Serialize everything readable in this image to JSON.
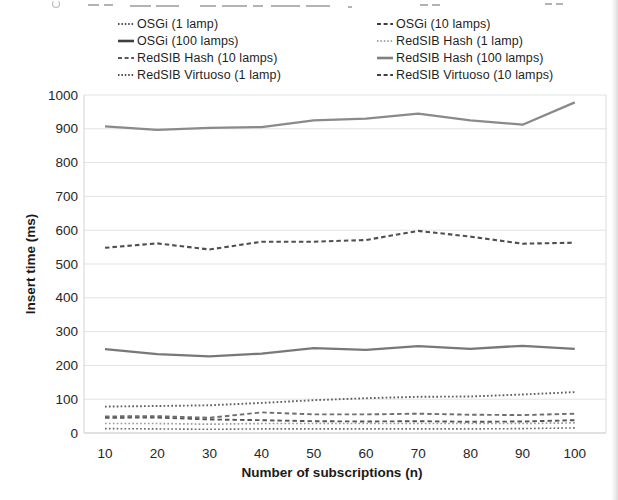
{
  "axes": {
    "y_title": "Insert time (ms)",
    "x_title": "Number of subscriptions (n)",
    "y_tick_labels": [
      "0",
      "100",
      "200",
      "300",
      "400",
      "500",
      "600",
      "700",
      "800",
      "900",
      "1000"
    ],
    "x_tick_labels": [
      "10",
      "20",
      "30",
      "40",
      "50",
      "60",
      "70",
      "80",
      "90",
      "100"
    ]
  },
  "legend": {
    "items": [
      {
        "label": "OSGi (1 lamp)",
        "style": "dotted",
        "color": "#4d4d4d"
      },
      {
        "label": "OSGi (10 lamps)",
        "style": "dashed",
        "color": "#3f3f3f"
      },
      {
        "label": "OSGi (100 lamps)",
        "style": "solid",
        "color": "#3f3f3f"
      },
      {
        "label": "RedSIB Hash (1 lamp)",
        "style": "dotted",
        "color": "#a6a6a6"
      },
      {
        "label": "RedSIB Hash (10 lamps)",
        "style": "dashed",
        "color": "#595959"
      },
      {
        "label": "RedSIB Hash (100 lamps)",
        "style": "solid",
        "color": "#808080"
      },
      {
        "label": "RedSIB Virtuoso (1 lamp)",
        "style": "dotted",
        "color": "#4d4d4d"
      },
      {
        "label": "RedSIB Virtuoso (10 lamps)",
        "style": "dashed",
        "color": "#404040"
      }
    ]
  },
  "chart_data": {
    "type": "line",
    "title": "",
    "xlabel": "Number of subscriptions (n)",
    "ylabel": "Insert time (ms)",
    "x": [
      10,
      20,
      30,
      40,
      50,
      60,
      70,
      80,
      90,
      100
    ],
    "ylim": [
      0,
      1000
    ],
    "ytick_step": 100,
    "grid": "horizontal light gray lines every 100 ms",
    "legend_position": "top, two columns",
    "series": [
      {
        "name": "OSGi (1 lamp)",
        "style": "dotted",
        "color": "#6a6a6a",
        "width": 1.6,
        "values": [
          13,
          12,
          11,
          12,
          12,
          12,
          12,
          12,
          13,
          15
        ]
      },
      {
        "name": "OSGi (10 lamps)",
        "style": "dashed",
        "color": "#565656",
        "width": 1.9,
        "values": [
          45,
          46,
          40,
          38,
          35,
          34,
          35,
          33,
          34,
          38
        ]
      },
      {
        "name": "OSGi (100 lamps)",
        "style": "solid",
        "color": "#787878",
        "width": 2.3,
        "values": [
          248,
          233,
          227,
          235,
          251,
          246,
          257,
          249,
          258,
          249
        ]
      },
      {
        "name": "RedSIB Hash (1 lamp)",
        "style": "dotted",
        "color": "#9b9b9b",
        "width": 1.7,
        "values": [
          28,
          28,
          26,
          28,
          28,
          28,
          28,
          28,
          28,
          30
        ]
      },
      {
        "name": "RedSIB Hash (10 lamps)",
        "style": "dashed",
        "color": "#6e6e6e",
        "width": 1.9,
        "values": [
          49,
          50,
          45,
          61,
          55,
          55,
          57,
          54,
          53,
          57
        ]
      },
      {
        "name": "RedSIB Hash (100 lamps)",
        "style": "solid",
        "color": "#8a8a8a",
        "width": 2.3,
        "values": [
          907,
          897,
          903,
          905,
          925,
          930,
          945,
          925,
          912,
          978
        ]
      },
      {
        "name": "RedSIB Virtuoso (1 lamp)",
        "style": "dotted",
        "color": "#5f5f5f",
        "width": 1.9,
        "values": [
          78,
          80,
          82,
          89,
          97,
          103,
          107,
          108,
          114,
          121
        ]
      },
      {
        "name": "RedSIB Virtuoso (10 lamps)",
        "style": "dashed",
        "color": "#4f4f4f",
        "width": 2.1,
        "values": [
          548,
          561,
          543,
          566,
          566,
          571,
          598,
          581,
          560,
          563
        ]
      }
    ]
  }
}
